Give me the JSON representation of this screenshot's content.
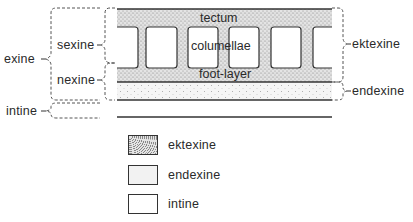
{
  "diagram": {
    "type": "pollen wall stratification",
    "layers_inner": {
      "tectum": "tectum",
      "columellae": "columellae",
      "foot_layer": "foot-layer"
    },
    "left_labels": {
      "exine": "exine",
      "sexine": "sexine",
      "nexine": "nexine",
      "intine": "intine"
    },
    "right_labels": {
      "ektexine": "ektexine",
      "endexine": "endexine"
    },
    "legend": [
      {
        "label": "ektexine",
        "pattern": "dense-stipple"
      },
      {
        "label": "endexine",
        "pattern": "sparse-stipple"
      },
      {
        "label": "intine",
        "pattern": "blank"
      }
    ],
    "colors": {
      "line": "#333333",
      "ektexine_fill": "#d9d9d9",
      "endexine_fill": "#f0f0f0",
      "intine_fill": "#ffffff"
    }
  }
}
